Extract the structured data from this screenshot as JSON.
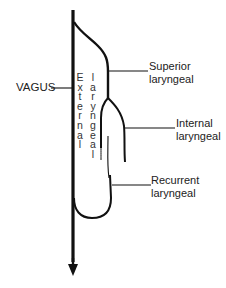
{
  "diagram": {
    "type": "anatomical nerve branching diagram",
    "labels": {
      "vagus": "VAGUS",
      "superior_laryngeal": [
        "Superior",
        "laryngeal"
      ],
      "internal_laryngeal": [
        "Internal",
        "laryngeal"
      ],
      "recurrent_laryngeal": [
        "Recurrent",
        "laryngeal"
      ],
      "external_vertical": "External",
      "laryngeal_vertical": "laryngeal"
    },
    "colors": {
      "stroke": "#111111",
      "background": "#ffffff",
      "text": "#222222"
    },
    "arrow": "downward"
  }
}
